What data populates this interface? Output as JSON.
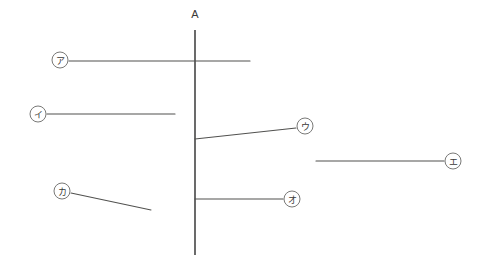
{
  "figure": {
    "title": "",
    "background_color": "#ffffff",
    "width": 491,
    "height": 273
  },
  "axis": {
    "name": "vertical-reference-axis",
    "label": "A",
    "label_x": 195,
    "label_y": 14,
    "x": 195,
    "y_top": 30,
    "y_bottom": 255,
    "color": "#2b2b2b"
  },
  "line_color": "#51514f",
  "marker_stroke_color": "#6a6a68",
  "segments": [
    {
      "id": "segment-a",
      "label": "ア",
      "label_cx": 60,
      "label_cy": 60,
      "label_r": 8,
      "x1": 69,
      "y1": 61,
      "x2": 250,
      "y2": 61,
      "crosses_axis": true
    },
    {
      "id": "segment-i",
      "label": "イ",
      "label_cx": 38,
      "label_cy": 114,
      "label_r": 8,
      "x1": 47,
      "y1": 114,
      "x2": 175,
      "y2": 114,
      "crosses_axis": false
    },
    {
      "id": "segment-u",
      "label": "ウ",
      "label_cx": 305,
      "label_cy": 126,
      "label_r": 8,
      "x1": 195,
      "y1": 139,
      "x2": 296,
      "y2": 128,
      "crosses_axis": false
    },
    {
      "id": "segment-e",
      "label": "エ",
      "label_cx": 453,
      "label_cy": 161,
      "label_r": 8,
      "x1": 316,
      "y1": 161,
      "x2": 444,
      "y2": 161,
      "crosses_axis": false
    },
    {
      "id": "segment-o",
      "label": "オ",
      "label_cx": 292,
      "label_cy": 199,
      "label_r": 8,
      "x1": 195,
      "y1": 199,
      "x2": 283,
      "y2": 199,
      "crosses_axis": false
    },
    {
      "id": "segment-ka",
      "label": "カ",
      "label_cx": 62,
      "label_cy": 191,
      "label_r": 8,
      "x1": 71,
      "y1": 193,
      "x2": 151,
      "y2": 210,
      "crosses_axis": false
    }
  ]
}
